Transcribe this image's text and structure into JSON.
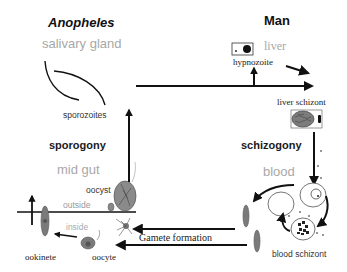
{
  "diagram": {
    "type": "life-cycle",
    "hosts": {
      "vector": {
        "title": "Anopheles"
      },
      "human": {
        "title": "Man"
      }
    },
    "phases": {
      "vector": "sporogony",
      "human": "schizogony"
    },
    "organs": {
      "salivary_gland": "salivary gland",
      "mid_gut": "mid gut",
      "liver": "liver",
      "blood": "blood"
    },
    "membrane": {
      "outside": "outside",
      "inside": "inside"
    },
    "stages": {
      "sporozoites": "sporozoites",
      "hypnozoite": "hypnozoite",
      "liver_schizont": "liver schizont",
      "blood_schizont": "blood schizont",
      "gamete_formation": "Gamete formation",
      "oocyte": "oocyte",
      "ookinete": "ookinete",
      "oocyst": "oocyst"
    },
    "colors": {
      "line": "#111111",
      "organ_text": "#a8a8a8",
      "cell_fill": "#8a8a8a",
      "background": "#ffffff"
    }
  }
}
